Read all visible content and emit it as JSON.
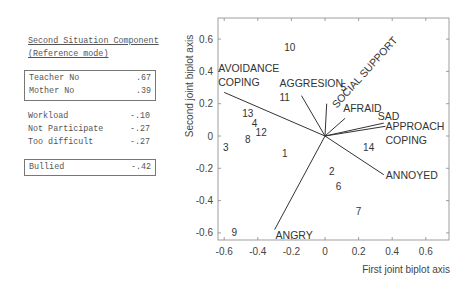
{
  "legend": {
    "title_line1": "Second Situation Component",
    "title_line2": "(Reference mode)",
    "groups": [
      {
        "boxed": true,
        "rows": [
          {
            "label": "Teacher No",
            "value": ".67"
          },
          {
            "label": "Mother No",
            "value": ".39"
          }
        ]
      },
      {
        "boxed": false,
        "rows": [
          {
            "label": "Workload",
            "value": "-.10"
          },
          {
            "label": "Not Participate",
            "value": "-.27"
          },
          {
            "label": "Too difficult",
            "value": "-.27"
          }
        ]
      },
      {
        "boxed": true,
        "rows": [
          {
            "label": "Bullied",
            "value": "-.42"
          }
        ]
      }
    ]
  },
  "chart_data": {
    "type": "scatter",
    "subtype": "biplot",
    "title": "",
    "xlabel": "First joint biplot axis",
    "ylabel": "Second joint biplot axis",
    "xlim": [
      -0.64,
      0.74
    ],
    "ylim": [
      -0.65,
      0.73
    ],
    "xticks": [
      -0.6,
      -0.4,
      -0.2,
      0,
      0.2,
      0.4,
      0.6
    ],
    "yticks": [
      -0.6,
      -0.4,
      -0.2,
      0,
      0.2,
      0.4,
      0.6
    ],
    "xtick_labels": [
      "-0.6",
      "-0.4",
      "-0.2",
      "0",
      "0.2",
      "0.4",
      "0.6"
    ],
    "ytick_labels": [
      "-0.6",
      "-0.4",
      "-0.2",
      "0",
      "0.2",
      "0.4",
      "0.6"
    ],
    "grid": false,
    "vectors": [
      {
        "name": "AVOIDANCE COPING",
        "label_lines": [
          "AVOIDANCE",
          "COPING"
        ],
        "x": -0.6,
        "y": 0.27
      },
      {
        "name": "AGGRESION",
        "label_lines": [
          "AGGRESION"
        ],
        "x": -0.14,
        "y": 0.25
      },
      {
        "name": "SOCIAL SUPPORT",
        "label_lines": [
          "SOCIAL SUPPORT"
        ],
        "x": 0.01,
        "y": 0.2
      },
      {
        "name": "AFRAID",
        "label_lines": [
          "AFRAID"
        ],
        "x": 0.12,
        "y": 0.11
      },
      {
        "name": "SAD",
        "label_lines": [
          "SAD"
        ],
        "x": 0.35,
        "y": 0.08
      },
      {
        "name": "APPROACH COPING",
        "label_lines": [
          "APPROACH",
          "COPING"
        ],
        "x": 0.36,
        "y": 0.06
      },
      {
        "name": "ANNOYED",
        "label_lines": [
          "ANNOYED"
        ],
        "x": 0.35,
        "y": -0.24
      },
      {
        "name": "ANGRY",
        "label_lines": [
          "ANGRY"
        ],
        "x": -0.3,
        "y": -0.58
      }
    ],
    "points": [
      {
        "label": "1",
        "x": -0.24,
        "y": -0.11
      },
      {
        "label": "2",
        "x": 0.04,
        "y": -0.22
      },
      {
        "label": "3",
        "x": -0.59,
        "y": -0.07
      },
      {
        "label": "4",
        "x": -0.42,
        "y": 0.08
      },
      {
        "label": "5",
        "x": 0.11,
        "y": 0.3
      },
      {
        "label": "6",
        "x": 0.08,
        "y": -0.31
      },
      {
        "label": "7",
        "x": 0.2,
        "y": -0.47
      },
      {
        "label": "8",
        "x": -0.46,
        "y": -0.02
      },
      {
        "label": "9",
        "x": -0.54,
        "y": -0.6
      },
      {
        "label": "10",
        "x": -0.21,
        "y": 0.55
      },
      {
        "label": "11",
        "x": -0.24,
        "y": 0.24
      },
      {
        "label": "12",
        "x": -0.38,
        "y": 0.02
      },
      {
        "label": "13",
        "x": -0.46,
        "y": 0.14
      },
      {
        "label": "14",
        "x": 0.26,
        "y": -0.07
      }
    ]
  }
}
